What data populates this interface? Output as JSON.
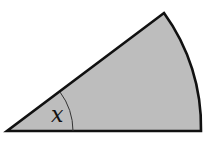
{
  "diagram": {
    "type": "circular-sector",
    "angle_label": "x",
    "fill_color": "#bdbdbd",
    "stroke_color": "#111111",
    "vertex": [
      7,
      131
    ],
    "radius": 194,
    "start_point": [
      201,
      131
    ],
    "end_point": [
      164,
      13
    ],
    "angle_arc_radius": 66
  }
}
